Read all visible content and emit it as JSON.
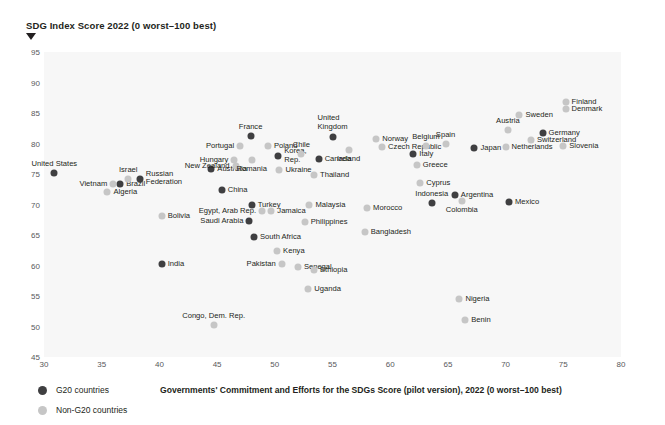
{
  "chart_data": {
    "type": "scatter",
    "title": "SDG Index Score 2022 (0 worst–100 best)",
    "ylabel": "SDG Index Score 2022 (0 worst–100 best)",
    "xlabel": "Governments' Commitment and Efforts for the SDGs Score (pilot version), 2022 (0 worst–100 best)",
    "xlim": [
      30,
      80
    ],
    "ylim": [
      45,
      95
    ],
    "xticks": [
      30,
      35,
      40,
      45,
      50,
      55,
      60,
      65,
      70,
      75,
      80
    ],
    "yticks": [
      45,
      50,
      55,
      60,
      65,
      70,
      75,
      80,
      85,
      90,
      95
    ],
    "grid": false,
    "legend_position": "bottom-left",
    "colors": {
      "g20": "#3f3f41",
      "non_g20": "#c6c6c6",
      "plot_background": "#f7f7f7"
    },
    "legend": [
      {
        "key": "g20",
        "label": "G20 countries"
      },
      {
        "key": "non_g20",
        "label": "Non-G20 countries"
      }
    ],
    "series": [
      {
        "name": "G20 countries",
        "group": "g20",
        "points": [
          {
            "label": "United States",
            "x": 30.9,
            "y": 75.2,
            "lpos": "above"
          },
          {
            "label": "Brazil",
            "x": 36.6,
            "y": 73.3,
            "lpos": "right"
          },
          {
            "label": "Russian Federation",
            "x": 38.3,
            "y": 74.2,
            "lpos": "right2"
          },
          {
            "label": "Australia",
            "x": 44.5,
            "y": 75.9,
            "lpos": "right"
          },
          {
            "label": "China",
            "x": 45.4,
            "y": 72.4,
            "lpos": "right"
          },
          {
            "label": "France",
            "x": 47.9,
            "y": 81.2,
            "lpos": "above"
          },
          {
            "label": "Korea, Rep.",
            "x": 50.3,
            "y": 77.9,
            "lpos": "right2"
          },
          {
            "label": "Turkey",
            "x": 48.0,
            "y": 70.0,
            "lpos": "right"
          },
          {
            "label": "Saudi Arabia",
            "x": 47.8,
            "y": 67.3,
            "lpos": "left"
          },
          {
            "label": "South Africa",
            "x": 48.2,
            "y": 64.6,
            "lpos": "right"
          },
          {
            "label": "India",
            "x": 40.2,
            "y": 60.3,
            "lpos": "right"
          },
          {
            "label": "Canada",
            "x": 53.8,
            "y": 77.4,
            "lpos": "right"
          },
          {
            "label": "United Kingdom",
            "x": 55.0,
            "y": 81.0,
            "lpos": "above2"
          },
          {
            "label": "Italy",
            "x": 62.0,
            "y": 78.3,
            "lpos": "right"
          },
          {
            "label": "Japan",
            "x": 67.3,
            "y": 79.2,
            "lpos": "right"
          },
          {
            "label": "Argentina",
            "x": 65.6,
            "y": 71.6,
            "lpos": "right"
          },
          {
            "label": "Indonesia",
            "x": 63.6,
            "y": 70.2,
            "lpos": "above"
          },
          {
            "label": "Mexico",
            "x": 70.3,
            "y": 70.4,
            "lpos": "right"
          },
          {
            "label": "Germany",
            "x": 73.2,
            "y": 81.8,
            "lpos": "right"
          }
        ]
      },
      {
        "name": "Non-G20 countries",
        "group": "non_g20",
        "points": [
          {
            "label": "Vietnam",
            "x": 36.0,
            "y": 73.3,
            "lpos": "left"
          },
          {
            "label": "Algeria",
            "x": 35.5,
            "y": 72.1,
            "lpos": "right"
          },
          {
            "label": "Israel",
            "x": 37.3,
            "y": 74.1,
            "lpos": "above"
          },
          {
            "label": "Bolivia",
            "x": 40.2,
            "y": 68.1,
            "lpos": "right"
          },
          {
            "label": "Hungary",
            "x": 46.5,
            "y": 77.3,
            "lpos": "left"
          },
          {
            "label": "New Zealand",
            "x": 46.6,
            "y": 76.3,
            "lpos": "left"
          },
          {
            "label": "Romania",
            "x": 48.0,
            "y": 77.3,
            "lpos": "below"
          },
          {
            "label": "Portugal",
            "x": 47.0,
            "y": 79.6,
            "lpos": "left"
          },
          {
            "label": "Poland",
            "x": 49.4,
            "y": 79.6,
            "lpos": "right"
          },
          {
            "label": "Chile",
            "x": 52.3,
            "y": 78.2,
            "lpos": "above"
          },
          {
            "label": "Ukraine",
            "x": 50.4,
            "y": 75.6,
            "lpos": "right"
          },
          {
            "label": "Egypt, Arab Rep.",
            "x": 48.9,
            "y": 69.0,
            "lpos": "left"
          },
          {
            "label": "Jamaica",
            "x": 49.7,
            "y": 69.0,
            "lpos": "right"
          },
          {
            "label": "Malaysia",
            "x": 53.0,
            "y": 69.9,
            "lpos": "right"
          },
          {
            "label": "Philippines",
            "x": 52.6,
            "y": 67.2,
            "lpos": "right"
          },
          {
            "label": "Kenya",
            "x": 50.2,
            "y": 62.3,
            "lpos": "right"
          },
          {
            "label": "Pakistan",
            "x": 50.6,
            "y": 60.3,
            "lpos": "left"
          },
          {
            "label": "Senegal",
            "x": 52.0,
            "y": 59.7,
            "lpos": "right"
          },
          {
            "label": "Ethiopia",
            "x": 53.4,
            "y": 59.2,
            "lpos": "right"
          },
          {
            "label": "Uganda",
            "x": 52.9,
            "y": 56.1,
            "lpos": "right"
          },
          {
            "label": "Congo, Dem. Rep.",
            "x": 44.7,
            "y": 50.2,
            "lpos": "above"
          },
          {
            "label": "Thailand",
            "x": 53.4,
            "y": 74.9,
            "lpos": "right"
          },
          {
            "label": "Ireland",
            "x": 56.4,
            "y": 79.0,
            "lpos": "below"
          },
          {
            "label": "Norway",
            "x": 58.8,
            "y": 80.8,
            "lpos": "right"
          },
          {
            "label": "Czech Republic",
            "x": 59.3,
            "y": 79.4,
            "lpos": "right"
          },
          {
            "label": "Belgium",
            "x": 63.1,
            "y": 79.6,
            "lpos": "above"
          },
          {
            "label": "Spain",
            "x": 64.8,
            "y": 79.9,
            "lpos": "above"
          },
          {
            "label": "Greece",
            "x": 62.3,
            "y": 76.5,
            "lpos": "right"
          },
          {
            "label": "Cyprus",
            "x": 62.6,
            "y": 73.5,
            "lpos": "right"
          },
          {
            "label": "Morocco",
            "x": 58.0,
            "y": 69.5,
            "lpos": "right"
          },
          {
            "label": "Bangladesh",
            "x": 57.8,
            "y": 65.5,
            "lpos": "right"
          },
          {
            "label": "Colombia",
            "x": 66.2,
            "y": 70.6,
            "lpos": "below"
          },
          {
            "label": "Nigeria",
            "x": 66.0,
            "y": 54.5,
            "lpos": "right"
          },
          {
            "label": "Benin",
            "x": 66.5,
            "y": 51.0,
            "lpos": "right"
          },
          {
            "label": "Austria",
            "x": 70.2,
            "y": 82.2,
            "lpos": "above"
          },
          {
            "label": "Sweden",
            "x": 71.2,
            "y": 84.7,
            "lpos": "right"
          },
          {
            "label": "Netherlands",
            "x": 70.0,
            "y": 79.5,
            "lpos": "right"
          },
          {
            "label": "Switzerland",
            "x": 72.2,
            "y": 80.5,
            "lpos": "right"
          },
          {
            "label": "Slovenia",
            "x": 75.0,
            "y": 79.6,
            "lpos": "right"
          },
          {
            "label": "Finland",
            "x": 75.2,
            "y": 86.8,
            "lpos": "right"
          },
          {
            "label": "Denmark",
            "x": 75.2,
            "y": 85.6,
            "lpos": "right"
          }
        ]
      }
    ]
  }
}
